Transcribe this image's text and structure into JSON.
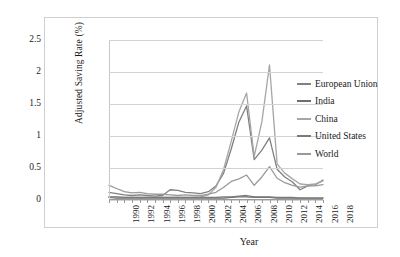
{
  "chart_data": {
    "type": "line",
    "title": "",
    "xlabel": "Year",
    "ylabel": "Adjusted Saving Rate (%)",
    "xlim": [
      1990,
      2018
    ],
    "ylim": [
      0,
      2.5
    ],
    "yticks": [
      "0",
      "0.5",
      "1",
      "1.5",
      "2",
      "2.5"
    ],
    "ytick_values": [
      0,
      0.5,
      1,
      1.5,
      2,
      2.5
    ],
    "grid": "horizontal",
    "legend_position": "right",
    "x": [
      1990,
      1991,
      1992,
      1993,
      1994,
      1995,
      1996,
      1997,
      1998,
      1999,
      2000,
      2001,
      2002,
      2003,
      2004,
      2005,
      2006,
      2007,
      2008,
      2009,
      2010,
      2011,
      2012,
      2013,
      2014,
      2015,
      2016,
      2017,
      2018
    ],
    "xtick_labels": [
      "1990",
      "1992",
      "1994",
      "1996",
      "1998",
      "2000",
      "2002",
      "2004",
      "2006",
      "2008",
      "2010",
      "2012",
      "2014",
      "2016",
      "2018"
    ],
    "series": [
      {
        "name": "European Union",
        "color": "#808080",
        "values": [
          0.12,
          0.1,
          0.08,
          0.07,
          0.08,
          0.07,
          0.06,
          0.07,
          0.16,
          0.15,
          0.12,
          0.11,
          0.1,
          0.13,
          0.22,
          0.42,
          0.8,
          1.22,
          1.47,
          0.63,
          0.78,
          0.97,
          0.48,
          0.36,
          0.28,
          0.16,
          0.22,
          0.24,
          0.31
        ]
      },
      {
        "name": "India",
        "color": "#6e6e6e",
        "values": [
          0.04,
          0.03,
          0.03,
          0.03,
          0.03,
          0.03,
          0.03,
          0.03,
          0.03,
          0.03,
          0.03,
          0.03,
          0.03,
          0.03,
          0.03,
          0.03,
          0.04,
          0.05,
          0.05,
          0.04,
          0.04,
          0.04,
          0.03,
          0.03,
          0.03,
          0.03,
          0.03,
          0.03,
          0.03
        ]
      },
      {
        "name": "China",
        "color": "#a6a6a6",
        "values": [
          0.05,
          0.04,
          0.04,
          0.04,
          0.04,
          0.04,
          0.04,
          0.04,
          0.04,
          0.04,
          0.04,
          0.04,
          0.05,
          0.08,
          0.2,
          0.48,
          0.92,
          1.38,
          1.67,
          0.68,
          1.22,
          2.11,
          0.56,
          0.42,
          0.33,
          0.25,
          0.24,
          0.25,
          0.3
        ]
      },
      {
        "name": "United States",
        "color": "#7a7a7a",
        "values": [
          0.05,
          0.05,
          0.04,
          0.04,
          0.04,
          0.04,
          0.04,
          0.04,
          0.04,
          0.04,
          0.04,
          0.04,
          0.04,
          0.04,
          0.04,
          0.05,
          0.05,
          0.06,
          0.07,
          0.05,
          0.05,
          0.05,
          0.04,
          0.04,
          0.04,
          0.03,
          0.03,
          0.03,
          0.03
        ]
      },
      {
        "name": "World",
        "color": "#9a9a9a",
        "values": [
          0.23,
          0.18,
          0.13,
          0.11,
          0.12,
          0.1,
          0.09,
          0.09,
          0.08,
          0.07,
          0.08,
          0.07,
          0.07,
          0.09,
          0.12,
          0.2,
          0.29,
          0.33,
          0.39,
          0.23,
          0.36,
          0.52,
          0.34,
          0.27,
          0.23,
          0.2,
          0.22,
          0.22,
          0.24
        ]
      }
    ]
  }
}
